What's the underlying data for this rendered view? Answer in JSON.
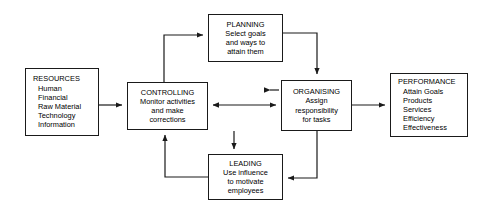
{
  "diagram": {
    "stroke_color": "#1a1a1a",
    "background": "#ffffff",
    "nodes": [
      {
        "id": "resources",
        "name": "resources-box",
        "heading": "RESOURCES",
        "items": [
          "Human",
          "Financial",
          "Raw Material",
          "Technology",
          "Information"
        ],
        "align": "left",
        "x": 25,
        "y": 68,
        "w": 74,
        "h": 68
      },
      {
        "id": "controlling",
        "name": "controlling-box",
        "heading": "CONTROLLING",
        "items": [
          "Monitor activities",
          "and make",
          "corrections"
        ],
        "align": "center",
        "x": 127,
        "y": 82,
        "w": 81,
        "h": 48
      },
      {
        "id": "planning",
        "name": "planning-box",
        "heading": "PLANNING",
        "items": [
          "Select goals",
          "and ways to",
          "attain them"
        ],
        "align": "center",
        "x": 208,
        "y": 14,
        "w": 75,
        "h": 48
      },
      {
        "id": "organising",
        "name": "organising-box",
        "heading": "ORGANISING",
        "items": [
          "Assign",
          "responsibility",
          "for tasks"
        ],
        "align": "center",
        "x": 281,
        "y": 80,
        "w": 71,
        "h": 51
      },
      {
        "id": "leading",
        "name": "leading-box",
        "heading": "LEADING",
        "items": [
          "Use influence",
          "to motivate",
          "employees"
        ],
        "align": "center",
        "x": 208,
        "y": 154,
        "w": 75,
        "h": 46
      },
      {
        "id": "performance",
        "name": "performance-box",
        "heading": "PERFORMANCE",
        "items": [
          "Attain Goals",
          "Products",
          "Services",
          "Efficiency",
          "Effectiveness"
        ],
        "align": "left",
        "x": 390,
        "y": 73,
        "w": 78,
        "h": 64
      }
    ],
    "connectors": [
      {
        "name": "resources-to-controlling",
        "from": "resources",
        "to": "controlling",
        "arrows": "single",
        "path": "M 99 105 L 124 105"
      },
      {
        "name": "controlling-to-planning",
        "from": "controlling",
        "to": "planning",
        "arrows": "single",
        "path": "M 164 82 L 164 35 L 205 35"
      },
      {
        "name": "planning-to-organising",
        "from": "planning",
        "to": "organising",
        "arrows": "single",
        "path": "M 283 33 L 317 33 L 317 77"
      },
      {
        "name": "controlling-organising-bidirectional",
        "from": "controlling",
        "to": "organising",
        "arrows": "double",
        "path": "M 211 105 L 278 105"
      },
      {
        "name": "organising-to-performance",
        "from": "organising",
        "to": "performance",
        "arrows": "single",
        "path": "M 352 105 L 387 105"
      },
      {
        "name": "organising-to-leading",
        "from": "organising",
        "to": "leading",
        "arrows": "single",
        "path": "M 317 131 L 317 178 L 286 178"
      },
      {
        "name": "planning-to-leading-top",
        "from": "planning",
        "to": "leading",
        "arrows": "single",
        "path": "M 234 131 L 234 151"
      },
      {
        "name": "leading-to-controlling",
        "from": "leading",
        "to": "controlling",
        "arrows": "single",
        "path": "M 208 177 L 165 177 L 165 133"
      },
      {
        "name": "organising-to-planning-up",
        "from": "organising",
        "to": "planning",
        "arrows": "single",
        "path": "M 281 90 L 270 90"
      }
    ]
  }
}
